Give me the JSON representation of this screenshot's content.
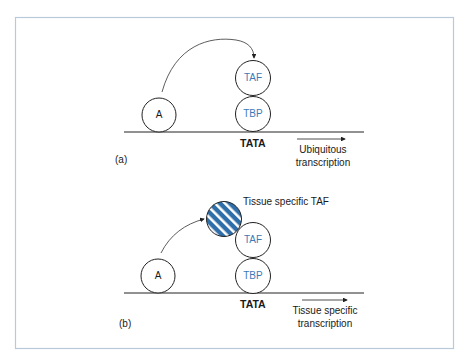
{
  "colors": {
    "frame": "#b9c9dc",
    "line": "#222222",
    "protein_label": "#3a7ab8",
    "tissue_taf_fill": "#2f6ea8",
    "tissue_taf_stripe": "#ffffff"
  },
  "panel_a": {
    "label": "(a)",
    "activator": "A",
    "taf": "TAF",
    "tbp": "TBP",
    "promoter": "TATA",
    "outcome_line1": "Ubiquitous",
    "outcome_line2": "transcription"
  },
  "panel_b": {
    "label": "(b)",
    "activator": "A",
    "taf": "TAF",
    "tbp": "TBP",
    "tissue_taf_label": "Tissue specific TAF",
    "promoter": "TATA",
    "outcome_line1": "Tissue specific",
    "outcome_line2": "transcription"
  }
}
